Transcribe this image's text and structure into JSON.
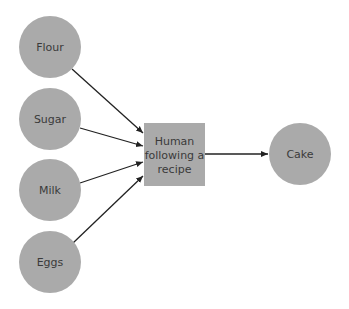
{
  "diagram": {
    "colors": {
      "node_fill": "#aaaaaa",
      "text": "#3a3a3a",
      "edge": "#222222",
      "background": "#ffffff"
    },
    "inputs": [
      {
        "id": "flour",
        "label": "Flour"
      },
      {
        "id": "sugar",
        "label": "Sugar"
      },
      {
        "id": "milk",
        "label": "Milk"
      },
      {
        "id": "eggs",
        "label": "Eggs"
      }
    ],
    "process": {
      "id": "human",
      "label_lines": [
        "Human",
        "following a",
        "recipe"
      ]
    },
    "output": {
      "id": "cake",
      "label": "Cake"
    },
    "edges": [
      {
        "from": "flour",
        "to": "human"
      },
      {
        "from": "sugar",
        "to": "human"
      },
      {
        "from": "milk",
        "to": "human"
      },
      {
        "from": "eggs",
        "to": "human"
      },
      {
        "from": "human",
        "to": "cake"
      }
    ]
  }
}
